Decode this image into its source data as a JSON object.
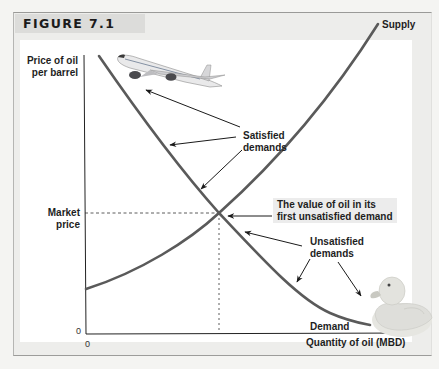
{
  "figure": {
    "title": "FIGURE 7.1"
  },
  "axes": {
    "y_label_line1": "Price of oil",
    "y_label_line2": "per barrel",
    "x_label": "Quantity of oil (MBD)",
    "y_tick_market_line1": "Market",
    "y_tick_market_line2": "price",
    "y_origin": "0",
    "x_origin": "0"
  },
  "curves": {
    "supply_label": "Supply",
    "demand_label": "Demand",
    "supply_color": "#5a5a5a",
    "demand_color": "#5a5a5a"
  },
  "annotations": {
    "satisfied_line1": "Satisfied",
    "satisfied_line2": "demands",
    "value_line1": "The value of oil in its",
    "value_line2": "first unsatisfied demand",
    "unsatisfied_line1": "Unsatisfied",
    "unsatisfied_line2": "demands"
  },
  "illustrations": {
    "top_left": "airplane",
    "bottom_right": "rubber-duck"
  },
  "colors": {
    "page_bg": "#f4f4f2",
    "frame_bg": "#ededeb",
    "header_band": "#dcdcda",
    "annotation_box": "#ececec"
  }
}
